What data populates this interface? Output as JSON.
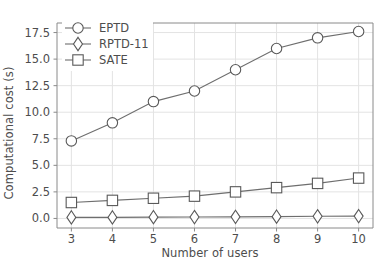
{
  "chart_data": {
    "type": "line",
    "title": "",
    "xlabel": "Number of users",
    "ylabel": "Computational cost (s)",
    "x": [
      3,
      4,
      5,
      6,
      7,
      8,
      9,
      10
    ],
    "xtick_labels": [
      "3",
      "4",
      "5",
      "6",
      "7",
      "8",
      "9",
      "10"
    ],
    "ytick_labels": [
      "0.0",
      "2.5",
      "5.0",
      "7.5",
      "10.0",
      "12.5",
      "15.0",
      "17.5"
    ],
    "ytick_values": [
      0.0,
      2.5,
      5.0,
      7.5,
      10.0,
      12.5,
      15.0,
      17.5
    ],
    "xlim": [
      2.65,
      10.35
    ],
    "ylim": [
      -0.9,
      18.4
    ],
    "grid": true,
    "legend_position": "upper left",
    "series": [
      {
        "name": "EPTD",
        "marker": "circle",
        "values": [
          7.3,
          9.0,
          11.0,
          12.0,
          14.0,
          16.0,
          17.0,
          17.6
        ]
      },
      {
        "name": "RPTD-11",
        "marker": "diamond",
        "values": [
          0.1,
          0.1,
          0.12,
          0.13,
          0.15,
          0.17,
          0.2,
          0.22
        ]
      },
      {
        "name": "SATE",
        "marker": "square",
        "values": [
          1.5,
          1.7,
          1.9,
          2.1,
          2.5,
          2.9,
          3.3,
          3.8
        ]
      }
    ],
    "colors": {
      "line": "#6e6e6e",
      "marker_edge": "#595959",
      "marker_face": "#ffffff",
      "grid": "#e3e3e3",
      "spine": "#8a8a8a",
      "text": "#4d4d4d",
      "background": "#ffffff"
    }
  }
}
